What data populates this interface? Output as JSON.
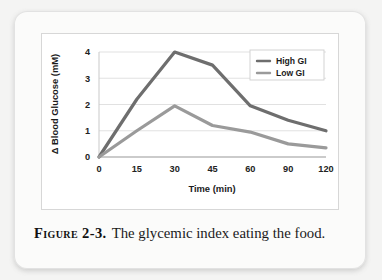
{
  "figure": {
    "caption_label": "Figure 2-3.",
    "caption_text": "The glycemic index eating the food."
  },
  "chart_data": {
    "type": "line",
    "title": "",
    "xlabel": "Time (min)",
    "ylabel": "Δ Blood Glucose (mM)",
    "categories": [
      "0",
      "15",
      "30",
      "45",
      "60",
      "90",
      "120"
    ],
    "x": [
      0,
      15,
      30,
      45,
      60,
      90,
      120
    ],
    "xlim": [
      0,
      120
    ],
    "ylim": [
      0,
      4
    ],
    "yticks": [
      "0",
      "1",
      "2",
      "3",
      "4"
    ],
    "ytick_values": [
      0,
      1,
      2,
      3,
      4
    ],
    "grid": "horizontal",
    "legend_position": "top-right",
    "series": [
      {
        "name": "High GI",
        "color": "#6e6e6e",
        "values": [
          0,
          2.2,
          4.0,
          3.5,
          1.95,
          1.4,
          1.0
        ]
      },
      {
        "name": "Low GI",
        "color": "#9a9a9a",
        "values": [
          0,
          1.0,
          1.95,
          1.2,
          0.95,
          0.5,
          0.35
        ]
      }
    ]
  }
}
